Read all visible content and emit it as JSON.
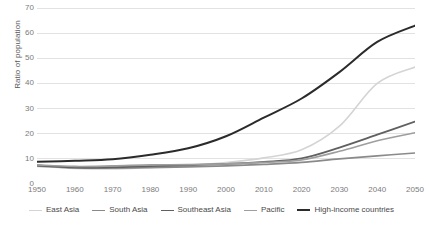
{
  "chart_data": {
    "type": "line",
    "title": "",
    "xlabel": "",
    "ylabel": "Ratio of population",
    "xlim": [
      1950,
      2050
    ],
    "ylim": [
      0,
      70
    ],
    "ytick_step": 10,
    "xtick_step": 10,
    "grid": "horizontal",
    "legend_position": "bottom",
    "x": [
      1950,
      1960,
      1970,
      1980,
      1990,
      2000,
      2010,
      2020,
      2030,
      2040,
      2050
    ],
    "xticklabels": [
      "1950",
      "1960",
      "1970",
      "1980",
      "1990",
      "2000",
      "2010",
      "2020",
      "2030",
      "2040",
      "2050"
    ],
    "yticklabels": [
      "0",
      "10",
      "20",
      "30",
      "40",
      "50",
      "60",
      "70"
    ],
    "series": [
      {
        "name": "East Asia",
        "color": "#d4d4d4",
        "width": 1.6,
        "values": [
          7.0,
          6.2,
          6.0,
          6.6,
          7.3,
          8.5,
          10.4,
          13.6,
          23.0,
          40.0,
          46.5
        ]
      },
      {
        "name": "South Asia",
        "color": "#8a8a8a",
        "width": 1.6,
        "values": [
          7.2,
          6.4,
          6.3,
          6.5,
          6.8,
          7.2,
          7.8,
          8.6,
          10.0,
          11.2,
          12.3
        ]
      },
      {
        "name": "Southeast Asia",
        "color": "#606060",
        "width": 1.8,
        "values": [
          7.4,
          6.6,
          6.7,
          7.1,
          7.5,
          8.0,
          8.8,
          10.2,
          14.5,
          19.6,
          24.8
        ]
      },
      {
        "name": "Pacific",
        "color": "#9e9e9e",
        "width": 1.6,
        "values": [
          7.6,
          7.0,
          7.2,
          7.6,
          7.7,
          8.0,
          8.6,
          9.6,
          13.0,
          17.2,
          20.4
        ]
      },
      {
        "name": "High-income countries",
        "color": "#2b2b2b",
        "width": 2.0,
        "values": [
          8.8,
          9.2,
          9.8,
          11.6,
          14.2,
          19.0,
          26.4,
          34.0,
          44.5,
          56.5,
          63.0
        ]
      }
    ]
  },
  "axes": {
    "y_title": "Ratio of population"
  }
}
